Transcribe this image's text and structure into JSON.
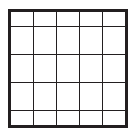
{
  "figure": {
    "kind": "shaded-grid-diagram",
    "rows": 5,
    "columns": 5,
    "total_cells": 25,
    "shaded_cell_count": 9,
    "unshaded_cell_count": 16,
    "colors": {
      "grid_line": "#231f20",
      "frame": "#231f20",
      "shaded_fill": "#5a5a5a",
      "unshaded_fill": "#ffffff",
      "background": "#ffffff"
    },
    "shaded_region_description": "rightmost column and bottom row",
    "cells": [
      [
        {
          "state": "empty"
        },
        {
          "state": "empty"
        },
        {
          "state": "empty"
        },
        {
          "state": "empty"
        },
        {
          "state": "shaded"
        }
      ],
      [
        {
          "state": "empty"
        },
        {
          "state": "empty"
        },
        {
          "state": "empty"
        },
        {
          "state": "empty"
        },
        {
          "state": "shaded"
        }
      ],
      [
        {
          "state": "empty"
        },
        {
          "state": "empty"
        },
        {
          "state": "empty"
        },
        {
          "state": "empty"
        },
        {
          "state": "shaded"
        }
      ],
      [
        {
          "state": "empty"
        },
        {
          "state": "empty"
        },
        {
          "state": "empty"
        },
        {
          "state": "empty"
        },
        {
          "state": "shaded"
        }
      ],
      [
        {
          "state": "shaded"
        },
        {
          "state": "shaded"
        },
        {
          "state": "shaded"
        },
        {
          "state": "shaded"
        },
        {
          "state": "shaded"
        }
      ]
    ]
  }
}
